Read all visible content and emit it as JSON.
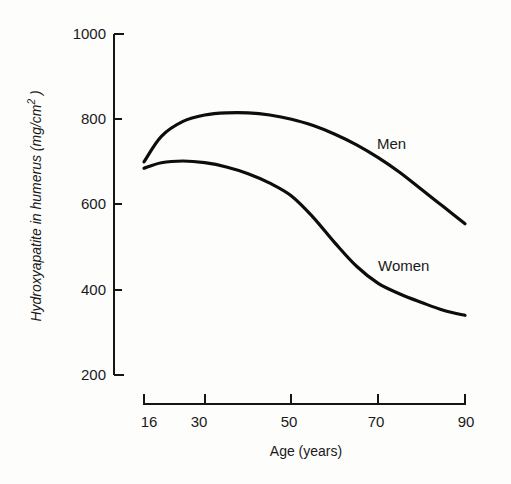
{
  "chart_data": {
    "type": "line",
    "title": "",
    "xlabel": "Age (years)",
    "ylabel": "Hydroxyapatite in humerus (mg/cm²)",
    "ylabel_main": "Hydroxyapatite in humerus (mg/cm",
    "ylabel_sup": "2",
    "ylabel_close": " )",
    "xlim": [
      16,
      90
    ],
    "ylim": [
      200,
      1000
    ],
    "xticks": [
      "16",
      "30",
      "50",
      "70",
      "90"
    ],
    "yticks": [
      "200",
      "400",
      "600",
      "800",
      "1000"
    ],
    "grid": false,
    "legend": "inline labels",
    "x": [
      16,
      20,
      25,
      30,
      35,
      40,
      45,
      50,
      55,
      60,
      65,
      70,
      75,
      80,
      85,
      90
    ],
    "series": [
      {
        "name": "Men",
        "values": [
          700,
          760,
          795,
          810,
          815,
          815,
          810,
          800,
          785,
          765,
          740,
          710,
          675,
          635,
          595,
          555
        ]
      },
      {
        "name": "Women",
        "values": [
          685,
          698,
          702,
          698,
          688,
          672,
          650,
          620,
          570,
          510,
          455,
          415,
          390,
          370,
          352,
          340
        ]
      }
    ],
    "annotations": [
      {
        "text": "Men",
        "x": 73,
        "y": 740
      },
      {
        "text": "Women",
        "x": 73,
        "y": 450
      }
    ]
  }
}
